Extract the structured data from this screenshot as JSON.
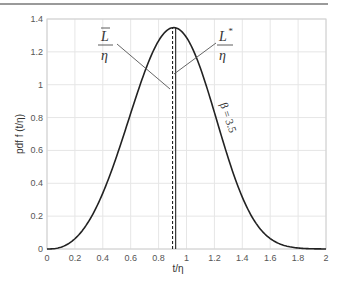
{
  "chart_data": {
    "type": "line",
    "title": "",
    "xlabel": "t/η",
    "ylabel": "pdf f (t/η)",
    "xlim": [
      0,
      2
    ],
    "ylim": [
      0,
      1.4
    ],
    "grid": true,
    "legend": null,
    "x_ticks": [
      "0",
      "0.2",
      "0.4",
      "0.6",
      "0.8",
      "1",
      "1.2",
      "1.4",
      "1.6",
      "1.8",
      "2"
    ],
    "y_ticks": [
      "0",
      "0.2",
      "0.4",
      "0.6",
      "0.8",
      "1",
      "1.2",
      "1.4"
    ],
    "series": [
      {
        "name": "Weibull pdf, β = 3.5",
        "x": [
          0,
          0.1,
          0.2,
          0.3,
          0.4,
          0.5,
          0.6,
          0.7,
          0.8,
          0.9,
          1.0,
          1.1,
          1.2,
          1.3,
          1.4,
          1.5,
          1.6,
          1.7,
          1.8,
          1.9,
          2.0
        ],
        "values": [
          0,
          0.011,
          0.062,
          0.169,
          0.335,
          0.552,
          0.791,
          1.027,
          1.22,
          1.344,
          1.288,
          1.09,
          0.786,
          0.464,
          0.214,
          0.073,
          0.017,
          0.003,
          0.0,
          0.0,
          0.0
        ]
      }
    ],
    "vertical_lines": [
      {
        "name": "mean",
        "x": 0.9,
        "style": "dashed",
        "label_top": "L̄",
        "label_bottom": "η"
      },
      {
        "name": "mode",
        "x": 0.908,
        "style": "solid",
        "label_top": "L*",
        "label_bottom": "η"
      }
    ],
    "annotations": [
      {
        "text": "β = 3.5",
        "x": 1.35,
        "y": 0.95,
        "rotation": 70
      },
      {
        "text": "L̄/η",
        "x": 0.55,
        "y": 1.25
      },
      {
        "text": "L*/η",
        "x": 1.26,
        "y": 1.25
      }
    ]
  },
  "labels": {
    "xlabel": "t/η",
    "ylabel": "pdf f (t/η)",
    "beta": "β = 3.5",
    "lbar_num": "L",
    "lbar_den": "η",
    "lstar_num": "L",
    "lstar_sup": "*",
    "lstar_den": "η"
  }
}
